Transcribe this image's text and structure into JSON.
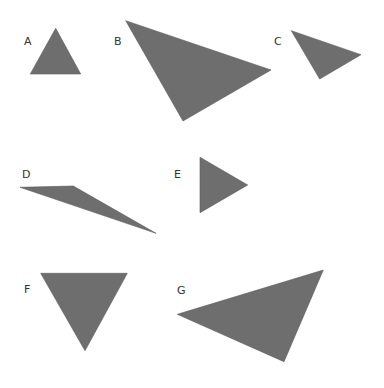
{
  "diagram": {
    "fill_color": "#6e6e6e",
    "label_color": "#333333",
    "triangles": [
      {
        "label": "A",
        "label_pos": [
          24,
          45
        ],
        "points": "55.7,28.3 30.3,74 80.7,74"
      },
      {
        "label": "B",
        "label_pos": [
          114,
          45
        ],
        "points": "125.7,20.7 271,70 183,121"
      },
      {
        "label": "C",
        "label_pos": [
          274,
          45
        ],
        "points": "291.3,30.7 361,54.7 319.7,79"
      },
      {
        "label": "D",
        "label_pos": [
          22,
          178
        ],
        "points": "20,187.3 73.3,186 156,233.3"
      },
      {
        "label": "E",
        "label_pos": [
          174,
          178
        ],
        "points": "200,157.3 247.7,185 200,212.7"
      },
      {
        "label": "F",
        "label_pos": [
          24,
          293
        ],
        "points": "40.7,273.3 127.3,273.3 85,350.7"
      },
      {
        "label": "G",
        "label_pos": [
          177,
          294
        ],
        "points": "177.3,314.3 323.3,270 284,361.7"
      }
    ]
  }
}
